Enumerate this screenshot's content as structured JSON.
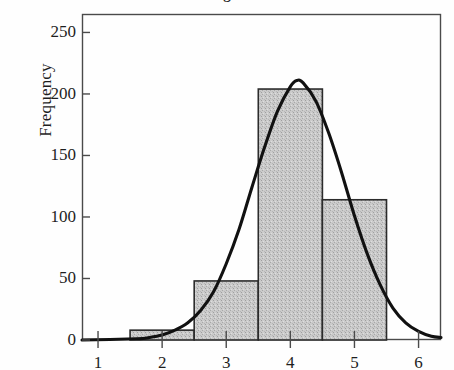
{
  "chart_data": {
    "type": "bar",
    "title": "",
    "title_partial_glyph": "g",
    "xlabel": "",
    "ylabel": "Frequency",
    "xlim": [
      0.75,
      6.35
    ],
    "ylim": [
      0,
      265
    ],
    "xticks": [
      1,
      2,
      3,
      4,
      5,
      6
    ],
    "xtick_labels": [
      "1",
      "2",
      "3",
      "4",
      "5",
      "6"
    ],
    "yticks": [
      0,
      50,
      100,
      150,
      200,
      250
    ],
    "ytick_labels": [
      "0",
      "50",
      "100",
      "150",
      "200",
      "250"
    ],
    "grid": false,
    "legend": null,
    "bin_width": 1,
    "bin_edges": [
      1.5,
      2.5,
      3.5,
      4.5,
      5.5
    ],
    "bin_centers": [
      2,
      3,
      4,
      5
    ],
    "categories": [
      "1.5-2.5",
      "2.5-3.5",
      "3.5-4.5",
      "4.5-5.5"
    ],
    "values": [
      8,
      48,
      204,
      114
    ],
    "bar_fill": "#c9c9c9",
    "bar_edge": "#2b2b2b",
    "series": [
      {
        "name": "Histogram",
        "type": "bar",
        "values": [
          8,
          48,
          204,
          114
        ]
      },
      {
        "name": "Normal curve",
        "type": "line",
        "color": "#111111",
        "peak_x": 4.1,
        "peak_y": 211,
        "mean": 4.1,
        "std": 0.72,
        "points": [
          {
            "x": 0.75,
            "y": 0
          },
          {
            "x": 1.6,
            "y": 1
          },
          {
            "x": 1.8,
            "y": 2
          },
          {
            "x": 2.0,
            "y": 4
          },
          {
            "x": 2.2,
            "y": 8
          },
          {
            "x": 2.4,
            "y": 14
          },
          {
            "x": 2.6,
            "y": 24
          },
          {
            "x": 2.8,
            "y": 39
          },
          {
            "x": 3.0,
            "y": 62
          },
          {
            "x": 3.2,
            "y": 90
          },
          {
            "x": 3.4,
            "y": 124
          },
          {
            "x": 3.6,
            "y": 157
          },
          {
            "x": 3.8,
            "y": 186
          },
          {
            "x": 4.0,
            "y": 206
          },
          {
            "x": 4.1,
            "y": 211
          },
          {
            "x": 4.2,
            "y": 209
          },
          {
            "x": 4.4,
            "y": 194
          },
          {
            "x": 4.6,
            "y": 168
          },
          {
            "x": 4.8,
            "y": 136
          },
          {
            "x": 5.0,
            "y": 101
          },
          {
            "x": 5.2,
            "y": 70
          },
          {
            "x": 5.4,
            "y": 45
          },
          {
            "x": 5.6,
            "y": 26
          },
          {
            "x": 5.8,
            "y": 14
          },
          {
            "x": 6.0,
            "y": 7
          },
          {
            "x": 6.2,
            "y": 3
          },
          {
            "x": 6.35,
            "y": 2
          }
        ]
      }
    ]
  },
  "axes": {
    "y_title": "Frequency"
  }
}
